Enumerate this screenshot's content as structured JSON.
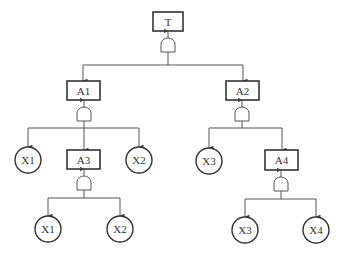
{
  "diagram": {
    "type": "fault-tree",
    "top_event": {
      "id": "T",
      "label": "T",
      "gate": "AND"
    },
    "intermediate_events": [
      {
        "id": "A1",
        "label": "A1",
        "gate": "AND",
        "parent": "T"
      },
      {
        "id": "A2",
        "label": "A2",
        "gate": "AND",
        "parent": "T"
      },
      {
        "id": "A3",
        "label": "A3",
        "gate": "AND",
        "parent": "A1"
      },
      {
        "id": "A4",
        "label": "A4",
        "gate": "AND",
        "parent": "A2"
      }
    ],
    "basic_events": [
      {
        "id": "X1_a",
        "label": "X1",
        "parent": "A1"
      },
      {
        "id": "X2_a",
        "label": "X2",
        "parent": "A1"
      },
      {
        "id": "X1_b",
        "label": "X1",
        "parent": "A3"
      },
      {
        "id": "X2_b",
        "label": "X2",
        "parent": "A3"
      },
      {
        "id": "X3_a",
        "label": "X3",
        "parent": "A2"
      },
      {
        "id": "X3_b",
        "label": "X3",
        "parent": "A4"
      },
      {
        "id": "X4_a",
        "label": "X4",
        "parent": "A4"
      }
    ],
    "labels": {
      "T": "T",
      "A1": "A1",
      "A2": "A2",
      "A3": "A3",
      "A4": "A4",
      "X1": "X1",
      "X2": "X2",
      "X3": "X3",
      "X4": "X4"
    }
  }
}
